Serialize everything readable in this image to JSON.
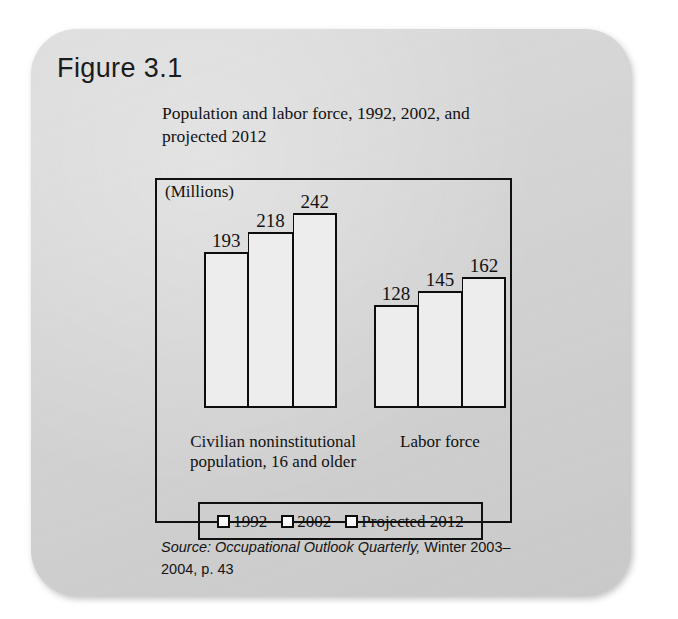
{
  "figure": {
    "number_label": "Figure 3.1"
  },
  "chart_title": "Population and labor force, 1992, 2002, and projected 2012",
  "units_label": "(Millions)",
  "legend": {
    "items": [
      {
        "label": "1992",
        "swatch_name": "legend-swatch-1992"
      },
      {
        "label": "2002",
        "swatch_name": "legend-swatch-2002"
      },
      {
        "label": "Projected 2012",
        "swatch_name": "legend-swatch-projected-2012"
      }
    ]
  },
  "source": {
    "italic_part": "Source: Occupational Outlook Quarterly,",
    "roman_part": " Winter 2003–2004, p. 43"
  },
  "colors": {
    "card_background": "#d4d4d4",
    "page_background": "#ffffff",
    "frame_line": "#111111",
    "bar_fill": "#ededed",
    "bar_outline": "#0d0d0d",
    "text": "#111111"
  },
  "chart_data": {
    "type": "bar",
    "title": "Population and labor force, 1992, 2002, and projected 2012",
    "xlabel": "",
    "ylabel": "(Millions)",
    "ylim": [
      0,
      260
    ],
    "grid": false,
    "legend_position": "bottom-inside",
    "categories": [
      "Civilian noninstitutional population, 16 and older",
      "Labor force"
    ],
    "series": [
      {
        "name": "1992",
        "values": [
          193,
          128
        ]
      },
      {
        "name": "2002",
        "values": [
          218,
          145
        ]
      },
      {
        "name": "Projected 2012",
        "values": [
          242,
          162
        ]
      }
    ],
    "groups": [
      {
        "category": "Civilian noninstitutional population, 16 and older",
        "caption_lines": [
          "Civilian noninstitutional",
          "population, 16 and older"
        ],
        "bars": [
          {
            "series": "1992",
            "value": 193,
            "value_label": "193"
          },
          {
            "series": "2002",
            "value": 218,
            "value_label": "218"
          },
          {
            "series": "Projected 2012",
            "value": 242,
            "value_label": "242"
          }
        ]
      },
      {
        "category": "Labor force",
        "caption_lines": [
          "Labor force"
        ],
        "bars": [
          {
            "series": "1992",
            "value": 128,
            "value_label": "128"
          },
          {
            "series": "2002",
            "value": 145,
            "value_label": "145"
          },
          {
            "series": "Projected 2012",
            "value": 162,
            "value_label": "162"
          }
        ]
      }
    ],
    "units": "Millions",
    "source": "Source: Occupational Outlook Quarterly, Winter 2003–2004, p. 43"
  }
}
